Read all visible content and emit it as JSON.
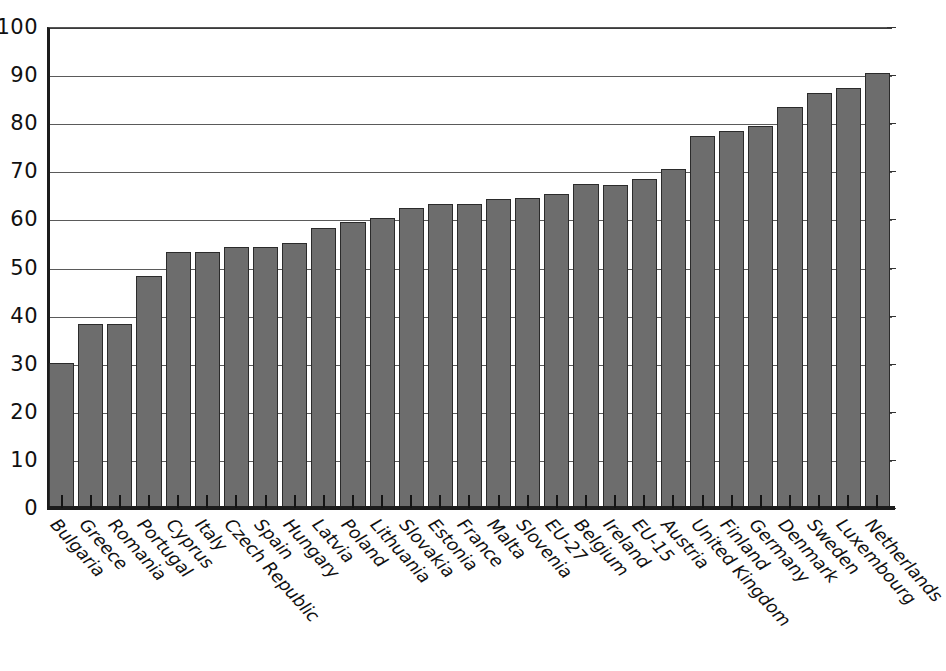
{
  "chart_data": {
    "type": "bar",
    "title": "",
    "subtitle": "",
    "xlabel": "",
    "ylabel": "",
    "ylim": [
      0,
      100
    ],
    "ytick_step": 10,
    "yticks": [
      100,
      90,
      80,
      70,
      60,
      50,
      40,
      30,
      20,
      10,
      0
    ],
    "grid": true,
    "legend": "none",
    "bar_color": "#6d6d6d",
    "bar_edge_color": "#2b2b2b",
    "axis_color": "#1c1c1c",
    "gridline_color": "#5a5a5a",
    "categories": [
      "Bulgaria",
      "Greece",
      "Romania",
      "Portugal",
      "Cyprus",
      "Italy",
      "Czech Republic",
      "Spain",
      "Hungary",
      "Latvia",
      "Poland",
      "Lithuania",
      "Slovakia",
      "Estonia",
      "France",
      "Malta",
      "Slovenia",
      "EU-27",
      "Belgium",
      "Ireland",
      "EU-15",
      "Austria",
      "United Kingdom",
      "Finland",
      "Germany",
      "Denmark",
      "Sweden",
      "Luxembourg",
      "Netherlands"
    ],
    "values": [
      30.1,
      38.3,
      38.3,
      48.3,
      53.3,
      53.2,
      54.2,
      54.2,
      55.2,
      58.3,
      59.4,
      60.3,
      62.3,
      63.2,
      63.2,
      64.3,
      64.4,
      65.3,
      67.3,
      67.2,
      68.3,
      70.4,
      77.3,
      78.4,
      79.4,
      83.4,
      86.3,
      87.4,
      90.5
    ]
  }
}
